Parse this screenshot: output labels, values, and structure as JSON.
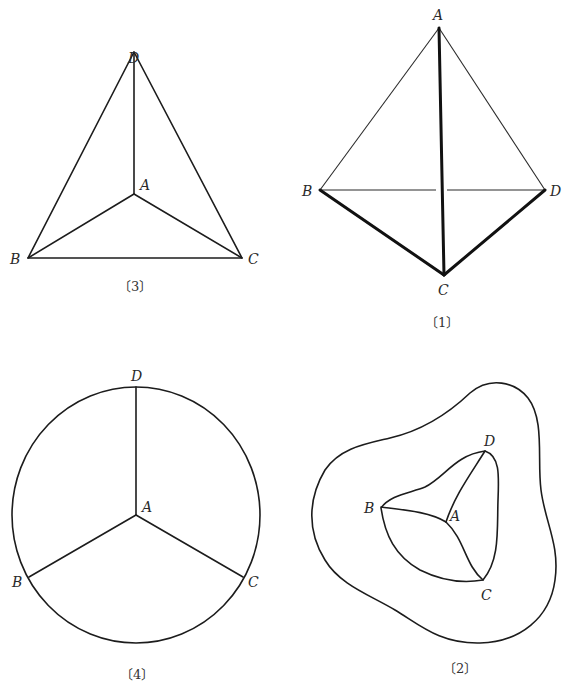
{
  "figures": [
    {
      "id": "3",
      "caption": "〔3〕",
      "labels": {
        "A": "A",
        "B": "B",
        "C": "C",
        "D": "D"
      },
      "description": "Triangle BCD with interior point A connected to B, C, D"
    },
    {
      "id": "1",
      "caption": "〔1〕",
      "labels": {
        "A": "A",
        "B": "B",
        "C": "C",
        "D": "D"
      },
      "description": "Tetrahedron-like drawing with A at top, B left, D right, C bottom; edges BC, AC, CD drawn thick"
    },
    {
      "id": "4",
      "caption": "〔4〕",
      "labels": {
        "A": "A",
        "B": "B",
        "C": "C",
        "D": "D"
      },
      "description": "Circle with center A and three radii to points B, C, D on circumference"
    },
    {
      "id": "2",
      "caption": "〔2〕",
      "labels": {
        "A": "A",
        "B": "B",
        "C": "C",
        "D": "D"
      },
      "description": "Irregular closed curve containing a curved triangle BCD with interior point A joined to B, C, D"
    }
  ]
}
